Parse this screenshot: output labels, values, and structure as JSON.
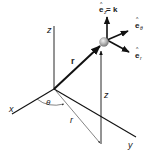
{
  "diagram": {
    "axes": {
      "x_label": "x",
      "y_label": "y",
      "z_label": "z"
    },
    "position_vector_label": "r",
    "radial_projection_label": "r",
    "height_label": "z",
    "angle_label": "θ",
    "unit_vectors": {
      "ez_base": "e",
      "ez_sub": "z",
      "ez_eq": " = k",
      "etheta_base": "e",
      "etheta_sub": "θ",
      "er_base": "e",
      "er_sub": "r",
      "hat": "^"
    },
    "colors": {
      "line": "#111111",
      "thin_line": "#333333",
      "particle": "#b8b8b8"
    }
  }
}
